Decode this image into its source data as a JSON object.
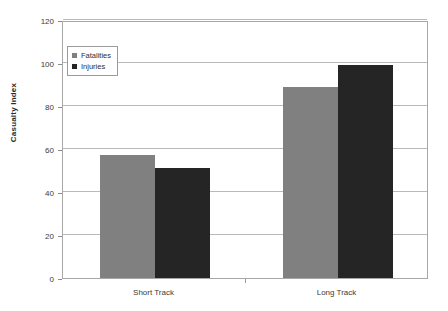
{
  "chart_data": {
    "type": "bar",
    "title": "",
    "xlabel": "",
    "ylabel": "Casualty Index",
    "categories": [
      "Short Track",
      "Long Track"
    ],
    "series": [
      {
        "name": "Fatalities",
        "color": "#808080",
        "values": [
          57,
          89
        ]
      },
      {
        "name": "Injuries",
        "color": "#252525",
        "values": [
          51,
          99
        ]
      }
    ],
    "ylim": [
      0,
      120
    ],
    "ytick_labels": [
      "0",
      "20",
      "40",
      "60",
      "80",
      "100",
      "120"
    ],
    "ytick_values": [
      0,
      20,
      40,
      60,
      80,
      100,
      120
    ],
    "grid": "horizontal",
    "legend_position": "upper-left-inside",
    "plot_background": "#ffffff",
    "frame_color": "#a8a8a8",
    "gridline_color": "#b9b9b9"
  },
  "axis": {
    "y_title": "Casualty Index"
  },
  "legend": {
    "entries": [
      {
        "label": "Fatalities"
      },
      {
        "label": "Injuries"
      }
    ]
  }
}
